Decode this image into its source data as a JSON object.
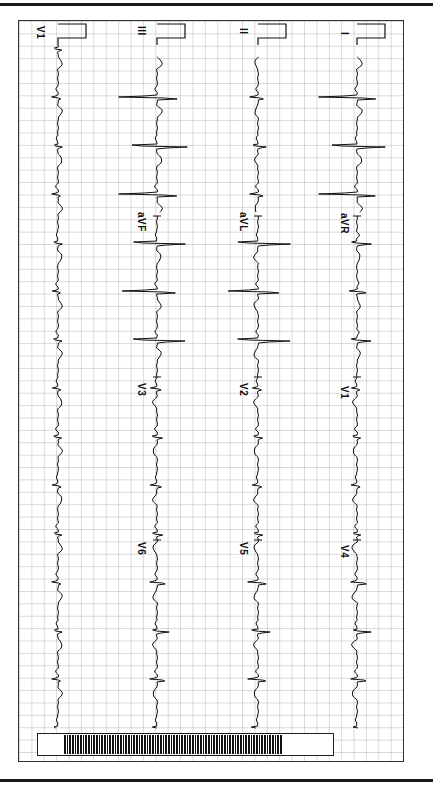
{
  "document": {
    "type": "12-lead ECG printout (rotated 90°)",
    "orientation": "time axis runs top to bottom",
    "colors": {
      "trace": "#111111",
      "grid": "#b0b0b0",
      "paper": "#ffffff",
      "frame": "#333333"
    }
  },
  "columns": [
    {
      "id": "rhythm",
      "baseline_x": 58,
      "leads": [
        {
          "label": "V1",
          "y": 57
        }
      ]
    },
    {
      "id": "row3",
      "baseline_x": 157,
      "leads": [
        {
          "label": "III",
          "y": 57
        },
        {
          "label": "aVF",
          "y": 216
        },
        {
          "label": "V3",
          "y": 377
        },
        {
          "label": "V6",
          "y": 540
        }
      ]
    },
    {
      "id": "row2",
      "baseline_x": 258,
      "leads": [
        {
          "label": "II",
          "y": 57
        },
        {
          "label": "aVL",
          "y": 216
        },
        {
          "label": "V2",
          "y": 377
        },
        {
          "label": "V5",
          "y": 540
        }
      ]
    },
    {
      "id": "row1",
      "baseline_x": 357,
      "leads": [
        {
          "label": "I",
          "y": 57
        },
        {
          "label": "aVR",
          "y": 216
        },
        {
          "label": "V1",
          "y": 377
        },
        {
          "label": "V4",
          "y": 540
        }
      ]
    }
  ],
  "labels": {
    "rhythm_v1": "V1",
    "iii": "III",
    "avf": "aVF",
    "v3": "V3",
    "v6": "V6",
    "ii": "II",
    "avl": "aVL",
    "v2": "V2",
    "v5": "V5",
    "i": "I",
    "avr": "aVR",
    "v1": "V1",
    "v4": "V4"
  },
  "rhythm": {
    "rr_interval_px": 48.5,
    "first_beat_y": 47
  }
}
